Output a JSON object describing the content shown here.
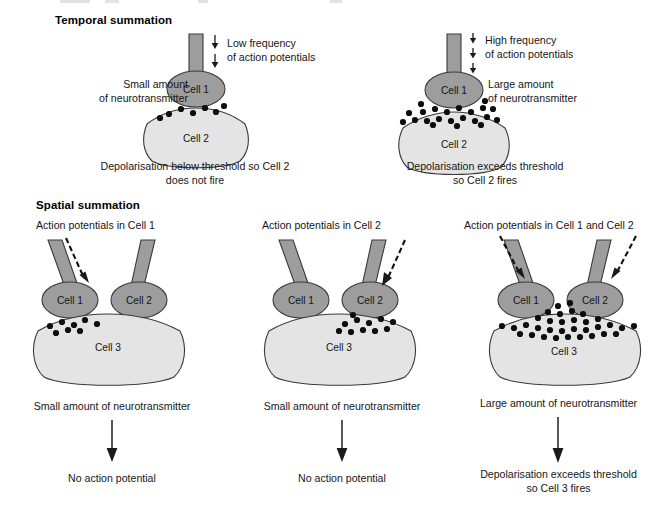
{
  "figure": {
    "background": "#ffffff",
    "cell_fill": "#9d9d9d",
    "post_cell_fill": "#e4e4e4",
    "vesicle_color": "#0d0d0d",
    "outline_color": "#3a3a3a"
  },
  "sections": {
    "temporal": {
      "title": "Temporal summation",
      "panels": [
        {
          "id": "temporal-low",
          "frequency_label_line1": "Low frequency",
          "frequency_label_line2": "of action potentials",
          "arrow_count": 2,
          "side_label_line1": "Small amount",
          "side_label_line2": "of neurotransmitter",
          "presynaptic_cell": "Cell 1",
          "postsynaptic_cell": "Cell 2",
          "vesicle_count": 7,
          "caption_line1": "Depolarisation below threshold so Cell 2",
          "caption_line2": "does not fire"
        },
        {
          "id": "temporal-high",
          "frequency_label_line1": "High frequency",
          "frequency_label_line2": "of action potentials",
          "arrow_count": 3,
          "side_label_line1": "Large amount",
          "side_label_line2": "of neurotransmitter",
          "presynaptic_cell": "Cell 1",
          "postsynaptic_cell": "Cell 2",
          "vesicle_count": 22,
          "caption_line1": "Depolarisation exceeds threshold",
          "caption_line2": "so Cell 2 fires"
        }
      ]
    },
    "spatial": {
      "title": "Spatial summation",
      "panels": [
        {
          "id": "spatial-cell1",
          "heading": "Action potentials in Cell 1",
          "cell_a": "Cell 1",
          "cell_b": "Cell 2",
          "postsynaptic_cell": "Cell 3",
          "active_inputs": [
            "Cell 1"
          ],
          "vesicle_count": 8,
          "amount_label": "Small amount of neurotransmitter",
          "outcome_line1": "No action potential",
          "outcome_line2": ""
        },
        {
          "id": "spatial-cell2",
          "heading": "Action potentials in Cell 2",
          "cell_a": "Cell 1",
          "cell_b": "Cell 2",
          "postsynaptic_cell": "Cell 3",
          "active_inputs": [
            "Cell 2"
          ],
          "vesicle_count": 11,
          "amount_label": "Small amount of neurotransmitter",
          "outcome_line1": "No action potential",
          "outcome_line2": ""
        },
        {
          "id": "spatial-both",
          "heading": "Action potentials in Cell 1 and Cell 2",
          "cell_a": "Cell 1",
          "cell_b": "Cell 2",
          "postsynaptic_cell": "Cell 3",
          "active_inputs": [
            "Cell 1",
            "Cell 2"
          ],
          "vesicle_count": 33,
          "amount_label": "Large amount of neurotransmitter",
          "outcome_line1": "Depolarisation exceeds threshold",
          "outcome_line2": "so Cell 3 fires"
        }
      ]
    }
  }
}
